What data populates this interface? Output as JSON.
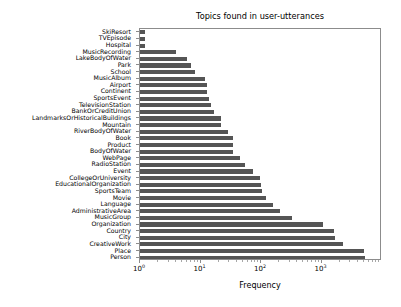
{
  "chart_data": {
    "type": "bar",
    "orientation": "horizontal",
    "title": "Topics found in user-utterances",
    "xlabel": "Frequency",
    "ylabel": "",
    "xscale": "log",
    "xlim": [
      1,
      10000
    ],
    "grid": false,
    "legend": null,
    "bar_color": "#555555",
    "categories": [
      "SkiResort",
      "TVEpisode",
      "Hospital",
      "MusicRecording",
      "LakeBodyOfWater",
      "Park",
      "School",
      "MusicAlbum",
      "Airport",
      "Continent",
      "SportsEvent",
      "TelevisionStation",
      "BankOrCreditUnion",
      "LandmarksOrHistoricalBuildings",
      "Mountain",
      "RiverBodyOfWater",
      "Book",
      "Product",
      "BodyOfWater",
      "WebPage",
      "RadioStation",
      "Event",
      "CollegeOrUniversity",
      "EducationalOrganization",
      "SportsTeam",
      "Movie",
      "Language",
      "AdministrativeArea",
      "MusicGroup",
      "Organization",
      "Country",
      "City",
      "CreativeWork",
      "Place",
      "Person"
    ],
    "values": [
      1.2,
      1.2,
      1.2,
      4,
      6,
      7,
      8,
      12,
      13,
      13,
      14,
      15,
      17,
      22,
      22,
      28,
      35,
      35,
      35,
      45,
      54,
      75,
      95,
      100,
      105,
      120,
      160,
      210,
      330,
      1050,
      1600,
      1700,
      2300,
      5000,
      5200
    ],
    "xticks": [
      {
        "value": 1,
        "label_base": "10",
        "label_exp": "0"
      },
      {
        "value": 10,
        "label_base": "10",
        "label_exp": "1"
      },
      {
        "value": 100,
        "label_base": "10",
        "label_exp": "2"
      },
      {
        "value": 1000,
        "label_base": "10",
        "label_exp": "3"
      }
    ]
  }
}
